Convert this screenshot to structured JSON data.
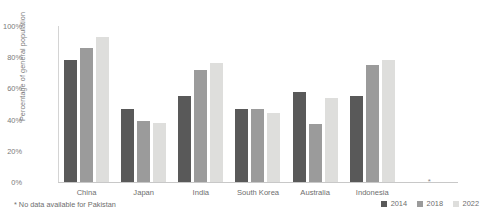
{
  "chart_data": {
    "type": "bar",
    "title": "",
    "subtitle": "",
    "xlabel": "",
    "ylabel": "Percentage of general population",
    "ylim": [
      0,
      100
    ],
    "ytick_labels": [
      "100%",
      "80%",
      "60%",
      "40%",
      "20%",
      "0%"
    ],
    "ytick_values": [
      100,
      80,
      60,
      40,
      20,
      0
    ],
    "grid": false,
    "legend_position": "bottom-right",
    "categories": [
      "China",
      "Japan",
      "India",
      "South Korea",
      "Australia",
      "Indonesia",
      ""
    ],
    "series": [
      {
        "name": "2014",
        "color": "#595959",
        "values": [
          78,
          47,
          55,
          47,
          58,
          55,
          null
        ]
      },
      {
        "name": "2018",
        "color": "#9b9b9b",
        "values": [
          86,
          39,
          72,
          47,
          37,
          75,
          null
        ]
      },
      {
        "name": "2022",
        "color": "#dededc",
        "values": [
          93,
          38,
          76,
          44,
          54,
          78,
          null
        ]
      }
    ],
    "annotations": [
      {
        "name": "pakistan-missing-marker",
        "marker": "*",
        "category_index": 6
      }
    ],
    "footnote": "* No data available for Pakistan"
  }
}
